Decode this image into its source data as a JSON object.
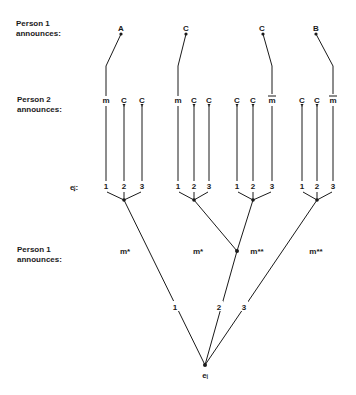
{
  "row_labels": {
    "person1_top": [
      "Person 1",
      "announces:"
    ],
    "person2": [
      "Person 2",
      "announces:"
    ],
    "ei": "eⱼ:",
    "person1_bottom": [
      "Person 1",
      "announces:"
    ]
  },
  "person1_top_announcements": [
    "A",
    "C",
    "C",
    "B"
  ],
  "person2_announcements": [
    [
      "m",
      "C",
      "C"
    ],
    [
      "m",
      "C",
      "C"
    ],
    [
      "C",
      "C",
      "m̅"
    ],
    [
      "C",
      "C",
      "m̅"
    ]
  ],
  "ei_values": [
    [
      "1",
      "2",
      "3"
    ],
    [
      "1",
      "2",
      "3"
    ],
    [
      "1",
      "2",
      "3"
    ],
    [
      "1",
      "2",
      "3"
    ]
  ],
  "person1_bottom_announcements": [
    "m*",
    "m*",
    "m**",
    "m**"
  ],
  "root_branches": [
    "1",
    "2",
    "3"
  ],
  "root_label": "eᵢ"
}
